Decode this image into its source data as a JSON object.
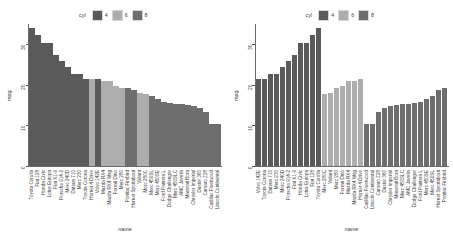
{
  "legend": {
    "title": "cyl",
    "items": [
      {
        "label": "4",
        "color": "#5a5a5a"
      },
      {
        "label": "6",
        "color": "#adadad"
      },
      {
        "label": "8",
        "color": "#6e6e6e"
      }
    ]
  },
  "axes": {
    "ylabel": "mpg",
    "xlabel": "name",
    "yticks": [
      "0",
      "10",
      "20",
      "30"
    ]
  },
  "chart_data": [
    {
      "type": "bar",
      "title": "",
      "xlabel": "name",
      "ylabel": "mpg",
      "ylim": [
        0,
        35
      ],
      "yticks": [
        0,
        10,
        20,
        30
      ],
      "grid": false,
      "legend_position": "top",
      "legend_title": "cyl",
      "sort": "mpg descending",
      "categories": [
        "Toyota Corolla",
        "Fiat 128",
        "Honda Civic",
        "Lotus Europa",
        "Fiat X1-9",
        "Porsche 914-2",
        "Merc 240D",
        "Datsun 710",
        "Merc 230",
        "Toyota Corona",
        "Hornet 4 Drive",
        "Volvo 142E",
        "Mazda RX4",
        "Mazda RX4 Wag",
        "Ferrari Dino",
        "Merc 280",
        "Pontiac Firebird",
        "Hornet Sportabout",
        "Valiant",
        "Merc 280C",
        "Merc 450SL",
        "Merc 450SE",
        "Ford Pantera L",
        "Dodge Challenger",
        "Merc 450SLC",
        "AMC Javelin",
        "Maserati Bora",
        "Chrysler Imperial",
        "Duster 360",
        "Camaro Z28",
        "Cadillac Fleetwood",
        "Lincoln Continental"
      ],
      "values": [
        33.9,
        32.4,
        30.4,
        30.4,
        27.3,
        26.0,
        24.4,
        22.8,
        22.8,
        21.5,
        21.4,
        21.4,
        21.0,
        21.0,
        19.7,
        19.2,
        19.2,
        18.7,
        18.1,
        17.8,
        17.3,
        16.4,
        15.8,
        15.5,
        15.2,
        15.2,
        15.0,
        14.7,
        14.3,
        13.3,
        10.4,
        10.4
      ],
      "groups": [
        4,
        4,
        4,
        4,
        4,
        4,
        4,
        4,
        4,
        4,
        6,
        4,
        6,
        6,
        6,
        6,
        8,
        8,
        6,
        6,
        8,
        8,
        8,
        8,
        8,
        8,
        8,
        8,
        8,
        8,
        8,
        8
      ]
    },
    {
      "type": "bar",
      "title": "",
      "xlabel": "name",
      "ylabel": "mpg",
      "ylim": [
        0,
        35
      ],
      "yticks": [
        0,
        10,
        20,
        30
      ],
      "grid": false,
      "legend_position": "top",
      "legend_title": "cyl",
      "sort": "cyl ascending, then mpg ascending",
      "categories": [
        "Volvo 142E",
        "Toyota Corona",
        "Datsun 710",
        "Merc 230",
        "Merc 240D",
        "Porsche 914-2",
        "Fiat X1-9",
        "Honda Civic",
        "Lotus Europa",
        "Fiat 128",
        "Toyota Corolla",
        "Merc 280C",
        "Valiant",
        "Merc 280",
        "Ferrari Dino",
        "Mazda RX4",
        "Mazda RX4 Wag",
        "Hornet 4 Drive",
        "Cadillac Fleetwood",
        "Lincoln Continental",
        "Camaro Z28",
        "Duster 360",
        "Chrysler Imperial",
        "Maserati Bora",
        "Merc 450SLC",
        "AMC Javelin",
        "Dodge Challenger",
        "Ford Pantera L",
        "Merc 450SE",
        "Merc 450SL",
        "Hornet Sportabout",
        "Pontiac Firebird"
      ],
      "values": [
        21.4,
        21.5,
        22.8,
        22.8,
        24.4,
        26.0,
        27.3,
        30.4,
        30.4,
        32.4,
        33.9,
        17.8,
        18.1,
        19.2,
        19.7,
        21.0,
        21.0,
        21.4,
        10.4,
        10.4,
        13.3,
        14.3,
        14.7,
        15.0,
        15.2,
        15.2,
        15.5,
        15.8,
        16.4,
        17.3,
        18.7,
        19.2
      ],
      "groups": [
        4,
        4,
        4,
        4,
        4,
        4,
        4,
        4,
        4,
        4,
        4,
        6,
        6,
        6,
        6,
        6,
        6,
        6,
        8,
        8,
        8,
        8,
        8,
        8,
        8,
        8,
        8,
        8,
        8,
        8,
        8,
        8
      ]
    }
  ]
}
